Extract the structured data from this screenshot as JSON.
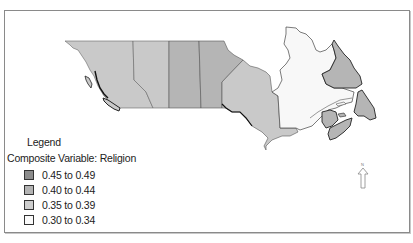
{
  "map": {
    "title": "Canada provinces choropleth",
    "north_label": "N",
    "provinces": [
      {
        "name": "British Columbia",
        "class": "0.35 to 0.39",
        "fill": "#c9c9c9"
      },
      {
        "name": "Alberta",
        "class": "0.35 to 0.39",
        "fill": "#c9c9c9"
      },
      {
        "name": "Saskatchewan",
        "class": "0.40 to 0.44",
        "fill": "#b5b5b5"
      },
      {
        "name": "Manitoba",
        "class": "0.40 to 0.44",
        "fill": "#b5b5b5"
      },
      {
        "name": "Ontario",
        "class": "0.35 to 0.39",
        "fill": "#c9c9c9"
      },
      {
        "name": "Quebec",
        "class": "0.30 to 0.34",
        "fill": "#f8f8f8"
      },
      {
        "name": "Newfoundland and Labrador",
        "class": "0.40 to 0.44",
        "fill": "#b5b5b5"
      },
      {
        "name": "Nova Scotia",
        "class": "0.40 to 0.44",
        "fill": "#b5b5b5"
      },
      {
        "name": "New Brunswick",
        "class": "0.40 to 0.44",
        "fill": "#b5b5b5"
      },
      {
        "name": "Prince Edward Island",
        "class": "0.40 to 0.44",
        "fill": "#b5b5b5"
      }
    ]
  },
  "legend": {
    "title": "Legend",
    "subtitle": "Composite Variable: Religion",
    "items": [
      {
        "label": "0.45 to 0.49",
        "color": "#8c8c8c"
      },
      {
        "label": "0.40 to 0.44",
        "color": "#b3b3b3"
      },
      {
        "label": "0.35 to 0.39",
        "color": "#cdcdcd"
      },
      {
        "label": "0.30 to 0.34",
        "color": "#fafafa"
      }
    ]
  }
}
